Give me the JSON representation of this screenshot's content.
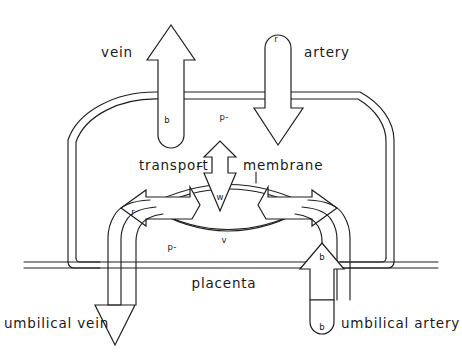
{
  "figure": {
    "background_color": "#ffffff",
    "line_color": "#1f1f1f"
  },
  "labels": {
    "vein": "vein",
    "artery": "artery",
    "transport": "transport",
    "transport_dash": "–",
    "membrane": "membrane",
    "placenta": "placenta",
    "umbilical_vein": "umbilical vein",
    "umbilical_artery": "umbilical artery"
  },
  "markers": {
    "maternal_vein_b": "b",
    "maternal_artery_r": "r",
    "maternal_p": "p-",
    "membrane_w": "w",
    "lens_v": "v",
    "fetal_r": "r",
    "fetal_p": "p-",
    "fetal_b": "b",
    "umbilical_artery_b": "b"
  },
  "diagram_data": {
    "type": "diagram",
    "subject": "maternal-fetal exchange across the placental transport membrane",
    "compartments": [
      {
        "name": "maternal side",
        "region": "upper arch",
        "vessels": [
          "vein",
          "artery"
        ],
        "markers": [
          "b",
          "r",
          "p-"
        ]
      },
      {
        "name": "placenta",
        "region": "central horizontal band",
        "markers": [
          "p-"
        ]
      },
      {
        "name": "fetal side",
        "region": "lower tubes",
        "vessels": [
          "umbilical vein",
          "umbilical artery"
        ],
        "markers": [
          "r",
          "p-",
          "b"
        ]
      }
    ],
    "flows": [
      {
        "name": "maternal artery inflow",
        "direction": "down",
        "label": "artery",
        "marker": "r"
      },
      {
        "name": "maternal vein outflow",
        "direction": "up",
        "label": "vein",
        "marker": "b"
      },
      {
        "name": "transport membrane exchange",
        "direction": "bidirectional-vertical",
        "marker": "w"
      },
      {
        "name": "lens exchange left",
        "direction": "left",
        "marker": "r"
      },
      {
        "name": "lens exchange right",
        "direction": "right",
        "marker": "b"
      },
      {
        "name": "umbilical vein outflow",
        "direction": "down",
        "label": "umbilical vein"
      },
      {
        "name": "umbilical artery inflow",
        "direction": "up",
        "label": "umbilical artery",
        "marker": "b"
      }
    ]
  }
}
